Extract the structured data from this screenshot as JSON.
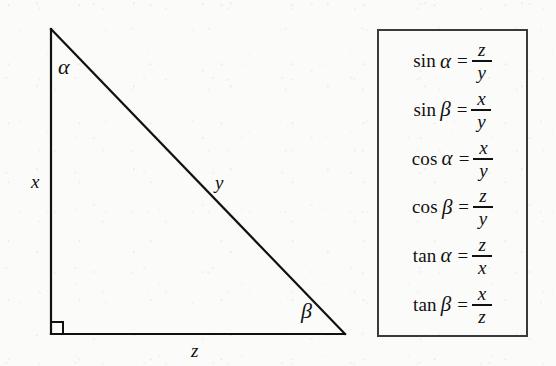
{
  "figure": {
    "type": "right-triangle-trigonometry-diagram",
    "background_color": "#fbfbfa",
    "ink_color": "#111111",
    "triangle": {
      "vertices": {
        "apex": [
          51,
          29
        ],
        "right_angle": [
          51,
          334
        ],
        "base_right": [
          345,
          334
        ]
      },
      "right_angle_marker_size": 12,
      "stroke_width": 2
    },
    "labels": {
      "leg_vertical": "x",
      "hypotenuse": "y",
      "leg_horizontal": "z",
      "angle_apex": "α",
      "angle_base_right": "β"
    }
  },
  "formula_box": {
    "border_color": "#3a3a3a",
    "rows": [
      {
        "fn": "sin",
        "arg": "α",
        "eq": "=",
        "numerator": "z",
        "denominator": "y"
      },
      {
        "fn": "sin",
        "arg": "β",
        "eq": "=",
        "numerator": "x",
        "denominator": "y"
      },
      {
        "fn": "cos",
        "arg": "α",
        "eq": "=",
        "numerator": "x",
        "denominator": "y"
      },
      {
        "fn": "cos",
        "arg": "β",
        "eq": "=",
        "numerator": "z",
        "denominator": "y"
      },
      {
        "fn": "tan",
        "arg": "α",
        "eq": "=",
        "numerator": "z",
        "denominator": "x"
      },
      {
        "fn": "tan",
        "arg": "β",
        "eq": "=",
        "numerator": "x",
        "denominator": "z"
      }
    ]
  }
}
